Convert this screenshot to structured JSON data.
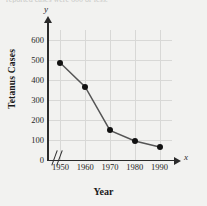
{
  "page": {
    "cutoff_text": "reported cases were 600 or less."
  },
  "chart_data": {
    "type": "line",
    "title": "",
    "xlabel": "Year",
    "ylabel": "Tetanus Cases",
    "x_axis_letter": "x",
    "y_axis_letter": "y",
    "axis_break": "//",
    "categories": [
      1950,
      1960,
      1970,
      1980,
      1990
    ],
    "x_tick_labels": [
      "1950",
      "1960",
      "1970",
      "1980",
      "1990"
    ],
    "values": [
      485,
      365,
      148,
      95,
      65
    ],
    "y_tick_labels": [
      "0",
      "100",
      "200",
      "300",
      "400",
      "500",
      "600"
    ],
    "y_ticks": [
      0,
      100,
      200,
      300,
      400,
      500,
      600
    ],
    "ylim": [
      0,
      650
    ],
    "xlim": [
      1945,
      1995
    ],
    "grid": true,
    "legend": "none",
    "series": [
      {
        "name": "Tetanus Cases",
        "values": [
          485,
          365,
          148,
          95,
          65
        ],
        "color": "#111111",
        "marker": "circle"
      }
    ],
    "colors": {
      "line": "#555555",
      "marker": "#111111",
      "grid": "#d8d8d6",
      "axis": "#2b2b2b",
      "background": "#f2f2f0"
    }
  }
}
